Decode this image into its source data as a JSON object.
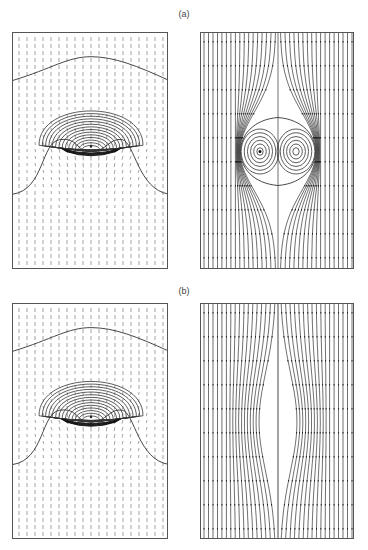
{
  "figure": {
    "parts": [
      {
        "label": "(a)",
        "label_pos": {
          "x": 184,
          "y": 9
        },
        "panels": [
          {
            "kind": "vector-field-contours",
            "x": 12,
            "y": 32,
            "w": 156,
            "h": 237
          },
          {
            "kind": "streamlines-vortex-pair",
            "x": 200,
            "y": 32,
            "w": 154,
            "h": 237
          }
        ]
      },
      {
        "label": "(b)",
        "label_pos": {
          "x": 184,
          "y": 286
        },
        "panels": [
          {
            "kind": "vector-field-contours",
            "x": 12,
            "y": 303,
            "w": 156,
            "h": 236
          },
          {
            "kind": "streamlines-no-vortex",
            "x": 200,
            "y": 303,
            "w": 154,
            "h": 236
          }
        ]
      }
    ],
    "caption_fragment": "",
    "colors": {
      "line": "#333333",
      "frame": "#555555",
      "arrow": "#666666",
      "label": "#444444"
    }
  }
}
